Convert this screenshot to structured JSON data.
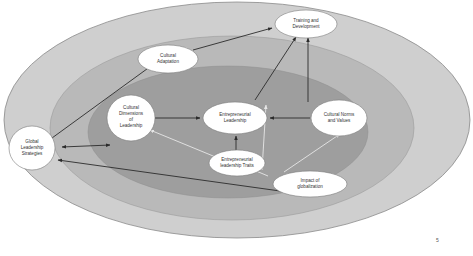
{
  "diagram": {
    "colors": {
      "background": "#ffffff",
      "outer_ring": "#cfcfcf",
      "middle_ring": "#b9b9b9",
      "inner_core": "#9e9e9e",
      "ring_border": "#8a8a8a",
      "node_fill": "#ffffff",
      "node_border": "#7a7a7a",
      "arrow_dark": "#2b2b2b",
      "arrow_light": "#e6e6e6"
    },
    "nodes": [
      {
        "id": "global",
        "label_lines": [
          "Global",
          "Leadership",
          "Strategies"
        ]
      },
      {
        "id": "adaptation",
        "label_lines": [
          "Cultural",
          "Adaptation"
        ]
      },
      {
        "id": "training",
        "label_lines": [
          "Training and",
          "Development"
        ]
      },
      {
        "id": "dimensions",
        "label_lines": [
          "Cultural",
          "Dimensions",
          "of",
          "Leadership"
        ]
      },
      {
        "id": "entrepreneurial",
        "label_lines": [
          "Entrepreneurial",
          "Leadership"
        ]
      },
      {
        "id": "norms",
        "label_lines": [
          "Cultural Norms",
          "and Values"
        ]
      },
      {
        "id": "traits",
        "label_lines": [
          "Entrepreneurial",
          "leadership Traits"
        ]
      },
      {
        "id": "globalization",
        "label_lines": [
          "Impact of",
          "globalization"
        ]
      }
    ],
    "edges": [
      {
        "from": "global",
        "to": "adaptation",
        "style": "dark"
      },
      {
        "from": "adaptation",
        "to": "training",
        "style": "dark"
      },
      {
        "from": "dimensions",
        "to": "global",
        "style": "dark-bidirectional"
      },
      {
        "from": "dimensions",
        "to": "entrepreneurial",
        "style": "dark"
      },
      {
        "from": "norms",
        "to": "entrepreneurial",
        "style": "dark"
      },
      {
        "from": "traits",
        "to": "entrepreneurial",
        "style": "dark"
      },
      {
        "from": "entrepreneurial",
        "to": "training",
        "style": "dark"
      },
      {
        "from": "norms",
        "to": "training",
        "style": "dark"
      },
      {
        "from": "globalization",
        "to": "global",
        "style": "dark"
      },
      {
        "from": "globalization",
        "to": "dimensions",
        "style": "light"
      },
      {
        "from": "globalization",
        "to": "entrepreneurial",
        "style": "light"
      },
      {
        "from": "globalization",
        "to": "norms",
        "style": "light"
      }
    ]
  },
  "page": {
    "number": "5"
  }
}
